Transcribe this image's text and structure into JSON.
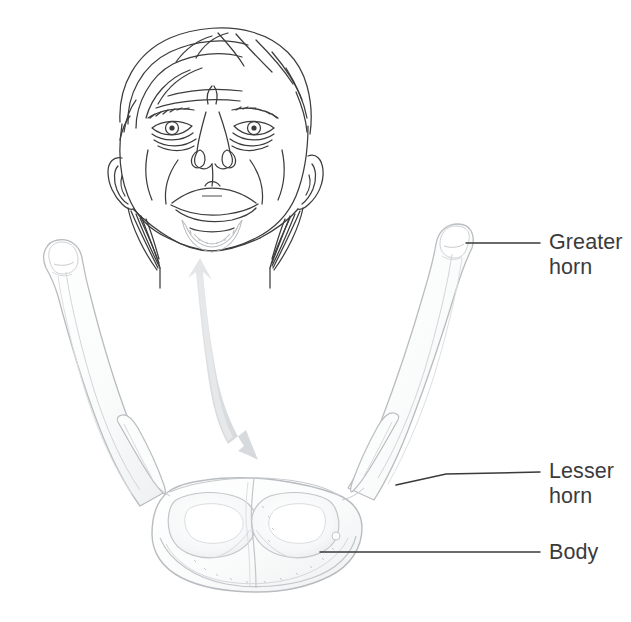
{
  "figure": {
    "background_color": "#ffffff",
    "line_color": "#3c3c3c",
    "bone_outline_color": "#b9bcc0",
    "bone_fill_color": "#fbfcfc",
    "bone_shade_color": "#eceef0",
    "arrow_color": "#dcdfe1",
    "label_color": "#3b3b3b",
    "leader_color": "#3a3a3a"
  },
  "labels": [
    {
      "id": "greater-horn",
      "text": "Greater\nhorn",
      "line1": "Greater",
      "line2": "horn",
      "leader": {
        "x1": 466,
        "y1": 243,
        "x2": 540,
        "y2": 243
      },
      "target": {
        "x": 466,
        "y": 243
      }
    },
    {
      "id": "lesser-horn",
      "text": "Lesser\nhorn",
      "line1": "Lesser",
      "line2": "horn",
      "leader": {
        "x1": 396,
        "y1": 485,
        "x2": 540,
        "y2": 472
      },
      "target": {
        "x": 396,
        "y": 485
      }
    },
    {
      "id": "body",
      "text": "Body",
      "line1": "Body",
      "line2": "",
      "leader": {
        "x1": 320,
        "y1": 552,
        "x2": 540,
        "y2": 552
      },
      "target": {
        "x": 320,
        "y": 552
      }
    }
  ],
  "illustration": {
    "head": {
      "name": "face-viewed-from-below",
      "description": "Line drawing of a human head tilted back, chin raised, showing underside of jaw and neck"
    },
    "arrow": {
      "name": "position-indicator-arrow",
      "description": "Curved grey arrow from neck of the head illustration down toward the hyoid bone",
      "direction": "down-right"
    },
    "bone": {
      "name": "hyoid-bone",
      "description": "U-shaped hyoid bone, anterior-superior view, with paired greater horns, lesser horns and central body",
      "parts": [
        "greater horn left",
        "greater horn right",
        "lesser horn left",
        "lesser horn right",
        "body"
      ]
    }
  }
}
